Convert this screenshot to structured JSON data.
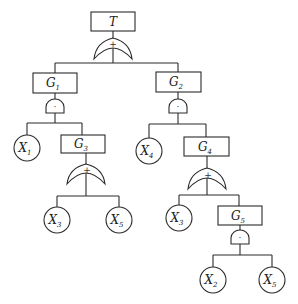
{
  "diagram": {
    "type": "fault-tree",
    "top_event": {
      "label": "T",
      "gate": "OR",
      "gate_symbol": "+"
    },
    "gates": {
      "G1": {
        "main": "G",
        "sub": "1",
        "gate": "AND",
        "gate_symbol": "·"
      },
      "G2": {
        "main": "G",
        "sub": "2",
        "gate": "AND",
        "gate_symbol": "·"
      },
      "G3": {
        "main": "G",
        "sub": "3",
        "gate": "OR",
        "gate_symbol": "+"
      },
      "G4": {
        "main": "G",
        "sub": "4",
        "gate": "OR",
        "gate_symbol": "+"
      },
      "G5": {
        "main": "G",
        "sub": "5",
        "gate": "AND",
        "gate_symbol": "·"
      }
    },
    "basic_events": {
      "g1_x1": {
        "main": "X",
        "sub": "1"
      },
      "g3_x3": {
        "main": "X",
        "sub": "3"
      },
      "g3_x5": {
        "main": "X",
        "sub": "5"
      },
      "g2_x4": {
        "main": "X",
        "sub": "4"
      },
      "g4_x3": {
        "main": "X",
        "sub": "3"
      },
      "g5_x2": {
        "main": "X",
        "sub": "2"
      },
      "g5_x5": {
        "main": "X",
        "sub": "5"
      }
    },
    "structure": [
      "T = G1 + G2",
      "G1 = X1 · G3",
      "G3 = X3 + X5",
      "G2 = X4 · G4",
      "G4 = X3 + G5",
      "G5 = X2 · X5"
    ]
  }
}
